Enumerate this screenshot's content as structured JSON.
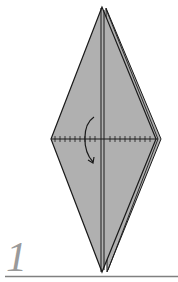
{
  "step": {
    "number": "1"
  },
  "diagram": {
    "paper_color": "#b0b0b0",
    "line_color": "#1a1a1a",
    "step_color": "#9a9a9a",
    "rule_color": "#808080",
    "elements": [
      "kite-shape-folded",
      "center-crease",
      "valley-fold-line",
      "fold-arrow",
      "baseline-rule"
    ]
  }
}
